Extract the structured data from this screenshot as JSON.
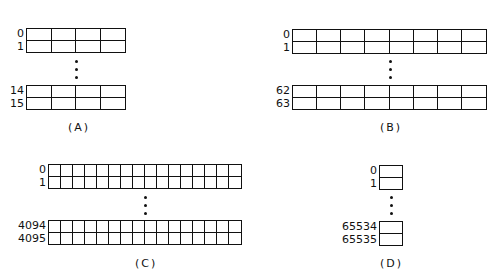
{
  "figures": [
    {
      "id": "A",
      "caption": "(A)",
      "columns": 4,
      "row_labels_top": [
        "0",
        "1"
      ],
      "row_labels_bottom": [
        "14",
        "15"
      ],
      "rows": 16
    },
    {
      "id": "B",
      "caption": "(B)",
      "columns": 8,
      "row_labels_top": [
        "0",
        "1"
      ],
      "row_labels_bottom": [
        "62",
        "63"
      ],
      "rows": 64
    },
    {
      "id": "C",
      "caption": "(C)",
      "columns": 16,
      "row_labels_top": [
        "0",
        "1"
      ],
      "row_labels_bottom": [
        "4094",
        "4095"
      ],
      "rows": 4096
    },
    {
      "id": "D",
      "caption": "(D)",
      "columns": 1,
      "row_labels_top": [
        "0",
        "1"
      ],
      "row_labels_bottom": [
        "65534",
        "65535"
      ],
      "rows": 65536
    }
  ],
  "colors": {
    "line": "#111111",
    "background": "#ffffff"
  }
}
